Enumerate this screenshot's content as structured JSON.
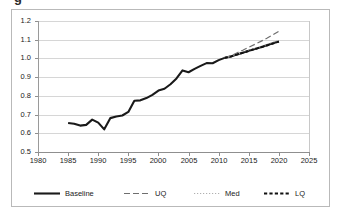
{
  "top_fragment": "g",
  "chart_data": {
    "type": "line",
    "title": "",
    "xlabel": "",
    "ylabel": "",
    "xlim": [
      1980,
      2025
    ],
    "ylim": [
      0.5,
      1.2
    ],
    "xticks": [
      1980,
      1985,
      1990,
      1995,
      2000,
      2005,
      2010,
      2015,
      2020,
      2025
    ],
    "yticks": [
      "0.5",
      "0.6",
      "0.7",
      "0.8",
      "0.9",
      "1.0",
      "1.1",
      "1.2"
    ],
    "grid": "horizontal",
    "legend_position": "bottom",
    "series": [
      {
        "name": "Baseline",
        "style": "solid",
        "color": "#1a1a1a",
        "width": 2.1,
        "x": [
          1985,
          1986,
          1987,
          1988,
          1989,
          1990,
          1991,
          1992,
          1993,
          1994,
          1995,
          1996,
          1997,
          1998,
          1999,
          2000,
          2001,
          2002,
          2003,
          2004,
          2005,
          2006,
          2007,
          2008,
          2009,
          2010,
          2011,
          2012,
          2013,
          2014,
          2015,
          2016,
          2017,
          2018,
          2019,
          2020
        ],
        "values": [
          0.655,
          0.651,
          0.641,
          0.645,
          0.673,
          0.657,
          0.621,
          0.681,
          0.69,
          0.695,
          0.714,
          0.774,
          0.776,
          0.788,
          0.805,
          0.828,
          0.838,
          0.862,
          0.893,
          0.936,
          0.926,
          0.944,
          0.96,
          0.975,
          0.974,
          0.991,
          1.003,
          1.01,
          1.021,
          1.031,
          1.041,
          1.05,
          1.06,
          1.07,
          1.081,
          1.091
        ]
      },
      {
        "name": "UQ",
        "style": "long-dash",
        "color": "#6e6e6e",
        "width": 1.2,
        "x": [
          2011,
          2012,
          2013,
          2014,
          2015,
          2016,
          2017,
          2018,
          2019,
          2020
        ],
        "values": [
          1.003,
          1.014,
          1.029,
          1.044,
          1.06,
          1.075,
          1.091,
          1.108,
          1.126,
          1.145
        ]
      },
      {
        "name": "Med",
        "style": "dotted",
        "color": "#b0b0b0",
        "width": 1.1,
        "x": [
          2011,
          2012,
          2013,
          2014,
          2015,
          2016,
          2017,
          2018,
          2019,
          2020
        ],
        "values": [
          1.003,
          1.011,
          1.022,
          1.033,
          1.044,
          1.054,
          1.064,
          1.075,
          1.086,
          1.097
        ]
      },
      {
        "name": "LQ",
        "style": "dash",
        "color": "#111111",
        "width": 1.9,
        "x": [
          2011,
          2012,
          2013,
          2014,
          2015,
          2016,
          2017,
          2018,
          2019,
          2020
        ],
        "values": [
          1.003,
          1.01,
          1.02,
          1.03,
          1.04,
          1.05,
          1.059,
          1.069,
          1.079,
          1.09
        ]
      }
    ]
  },
  "legend": {
    "items": [
      {
        "label": "Baseline",
        "style": "solid"
      },
      {
        "label": "UQ",
        "style": "long-dash"
      },
      {
        "label": "Med",
        "style": "dotted"
      },
      {
        "label": "LQ",
        "style": "dash"
      }
    ]
  }
}
